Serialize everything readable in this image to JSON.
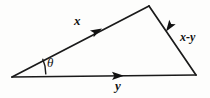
{
  "figure": {
    "type": "vector-triangle-diagram",
    "background_color": "#fdfdfc",
    "stroke_color": "#1a1a1a",
    "labels": {
      "side_upper_left": "x",
      "side_right": "x-y",
      "side_bottom": "y",
      "angle": "θ"
    },
    "icons": {
      "arrowhead_upper_left": "arrowhead-up-right-icon",
      "arrowhead_right": "arrowhead-up-left-icon",
      "arrowhead_bottom": "arrowhead-right-icon",
      "angle_arc": "angle-arc-icon"
    },
    "geometry": {
      "vertex_left": [
        12,
        77
      ],
      "vertex_apex": [
        149,
        6
      ],
      "vertex_right": [
        196,
        75
      ],
      "arrow_on_x": [
        99,
        30
      ],
      "arrow_on_xy": [
        169,
        36
      ],
      "arrow_on_y": [
        121,
        75
      ],
      "arc_center": [
        12,
        77
      ],
      "arc_radius": 38
    }
  }
}
